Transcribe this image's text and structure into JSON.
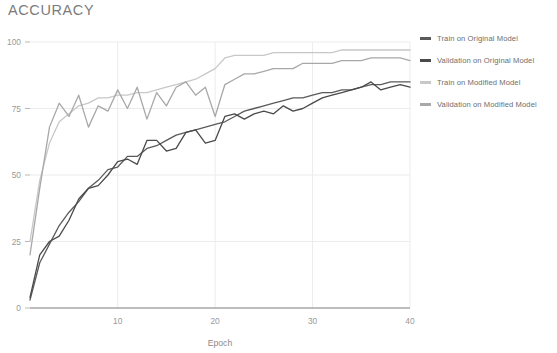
{
  "chart_title": "ACCURACY",
  "legend": {
    "position": "right",
    "items": [
      {
        "label": "Train on Original Model",
        "color": "#5a5a5a"
      },
      {
        "label": "Validation on Original Model",
        "color": "#4a4a4a"
      },
      {
        "label": "Train on Modified Model",
        "color": "#c8c8c8"
      },
      {
        "label": "Validation on Modified Model",
        "color": "#a8a8a8"
      }
    ]
  },
  "chart_data": {
    "type": "line",
    "title": "ACCURACY",
    "xlabel": "Epoch",
    "ylabel": "",
    "xlim": [
      1,
      40
    ],
    "ylim": [
      0,
      100
    ],
    "xticks": [
      10,
      20,
      30,
      40
    ],
    "yticks": [
      0,
      25,
      50,
      75,
      100
    ],
    "grid": true,
    "x": [
      1,
      2,
      3,
      4,
      5,
      6,
      7,
      8,
      9,
      10,
      11,
      12,
      13,
      14,
      15,
      16,
      17,
      18,
      19,
      20,
      21,
      22,
      23,
      24,
      25,
      26,
      27,
      28,
      29,
      30,
      31,
      32,
      33,
      34,
      35,
      36,
      37,
      38,
      39,
      40
    ],
    "series": [
      {
        "name": "Train on Original Model",
        "color": "#5a5a5a",
        "values": [
          3,
          17,
          24,
          31,
          36,
          40,
          45,
          48,
          52,
          53,
          57,
          57,
          60,
          61,
          63,
          65,
          66,
          67,
          68,
          69,
          70,
          72,
          74,
          75,
          76,
          77,
          78,
          79,
          79,
          80,
          81,
          81,
          82,
          82,
          83,
          84,
          84,
          85,
          85,
          85
        ]
      },
      {
        "name": "Validation on Original Model",
        "color": "#4a4a4a",
        "values": [
          4,
          20,
          25,
          27,
          33,
          41,
          45,
          46,
          50,
          55,
          56,
          54,
          63,
          63,
          59,
          60,
          66,
          67,
          62,
          63,
          72,
          73,
          71,
          73,
          74,
          73,
          76,
          74,
          75,
          77,
          79,
          80,
          81,
          82,
          83,
          85,
          82,
          83,
          84,
          83
        ]
      },
      {
        "name": "Train on Modified Model",
        "color": "#c8c8c8",
        "values": [
          25,
          48,
          62,
          70,
          73,
          76,
          77,
          79,
          79,
          80,
          80,
          81,
          81,
          82,
          83,
          84,
          85,
          86,
          88,
          90,
          94,
          95,
          95,
          95,
          95,
          96,
          96,
          96,
          96,
          96,
          96,
          96,
          97,
          97,
          97,
          97,
          97,
          97,
          97,
          97
        ]
      },
      {
        "name": "Validation on Modified Model",
        "color": "#a8a8a8",
        "values": [
          20,
          45,
          68,
          77,
          72,
          80,
          68,
          76,
          74,
          82,
          75,
          83,
          71,
          81,
          76,
          83,
          85,
          80,
          83,
          72,
          84,
          86,
          88,
          88,
          89,
          90,
          90,
          90,
          92,
          92,
          92,
          92,
          93,
          93,
          93,
          94,
          94,
          94,
          94,
          93
        ]
      }
    ]
  }
}
